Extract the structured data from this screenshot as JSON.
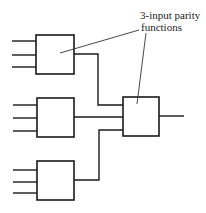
{
  "diagram": {
    "annotation": {
      "line1": "3-input parity",
      "line2": "functions"
    },
    "gates": [
      {
        "id": "gate-1",
        "type": "3-input parity",
        "inputs": 3
      },
      {
        "id": "gate-2",
        "type": "3-input parity",
        "inputs": 3
      },
      {
        "id": "gate-3",
        "type": "3-input parity",
        "inputs": 3
      },
      {
        "id": "gate-out",
        "type": "3-input parity",
        "inputs": 3
      }
    ],
    "colors": {
      "stroke": "#1a1a1a",
      "background": "#ffffff"
    }
  }
}
